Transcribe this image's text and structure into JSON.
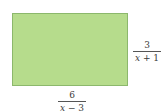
{
  "diagram": {
    "shape": "rectangle",
    "fill_color": "#b6dc8c",
    "border_color": "#8cb86c",
    "side_right": {
      "numerator": "3",
      "denominator_var": "x",
      "denominator_rest": " + 1"
    },
    "side_bottom": {
      "numerator": "6",
      "denominator_var": "x",
      "denominator_rest": " − 3"
    }
  }
}
